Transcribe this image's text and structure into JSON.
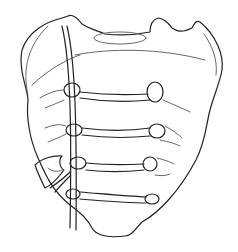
{
  "illustration": {
    "subject": "sacrum line drawing",
    "stroke_color": "#222222",
    "fine_stroke_color": "#555555",
    "background": "#ffffff"
  }
}
